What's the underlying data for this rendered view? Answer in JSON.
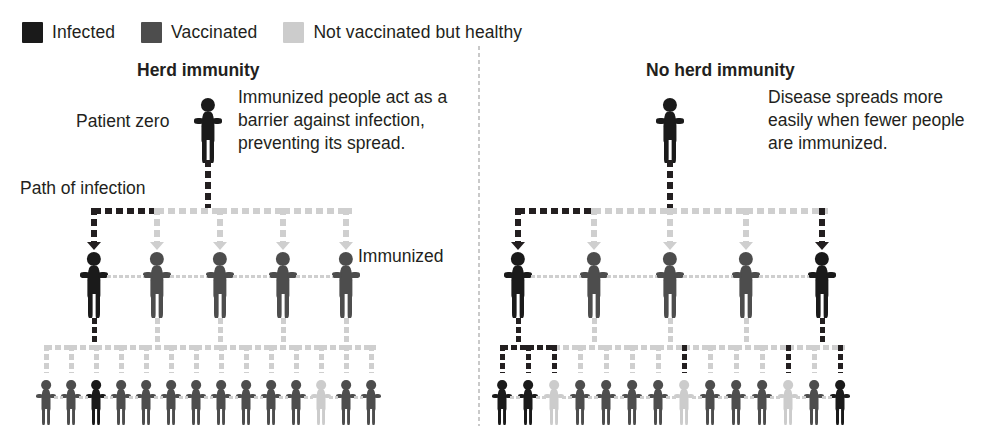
{
  "legend": {
    "items": [
      {
        "label": "Infected",
        "color": "#1a1a1a",
        "swatch_name": "legend-swatch-infected"
      },
      {
        "label": "Vaccinated",
        "color": "#4d4d4d",
        "swatch_name": "legend-swatch-vaccinated"
      },
      {
        "label": "Not vaccinated but healthy",
        "color": "#cccccc",
        "swatch_name": "legend-swatch-healthy"
      }
    ]
  },
  "colors": {
    "infected": "#1a1a1a",
    "vaccinated": "#4d4d4d",
    "healthy": "#cccccc",
    "path_infected": "#231f20",
    "path_blocked": "#cfcfcf",
    "divider": "#c9c9c9",
    "text": "#231f20"
  },
  "left_panel": {
    "title": "Herd immunity",
    "patient_zero_label": "Patient zero",
    "path_label": "Path of infection",
    "immunized_label": "Immunized",
    "callout": "Immunized people act as a barrier against infection, preventing its spread.",
    "rows": {
      "row0": [
        "infected"
      ],
      "row1": [
        "infected",
        "vaccinated",
        "vaccinated",
        "vaccinated",
        "vaccinated"
      ],
      "row2": [
        "vaccinated",
        "vaccinated",
        "infected",
        "vaccinated",
        "vaccinated",
        "vaccinated",
        "vaccinated",
        "vaccinated",
        "vaccinated",
        "vaccinated",
        "vaccinated",
        "healthy",
        "vaccinated",
        "vaccinated"
      ]
    },
    "row1_arrow_states": [
      "infected",
      "blocked",
      "blocked",
      "blocked",
      "blocked"
    ],
    "row2_arrow_states": [
      "blocked",
      "blocked",
      "blocked",
      "blocked",
      "blocked",
      "blocked",
      "blocked",
      "blocked",
      "blocked",
      "blocked",
      "blocked",
      "blocked",
      "blocked",
      "blocked"
    ]
  },
  "right_panel": {
    "title": "No herd immunity",
    "callout": "Disease spreads more easily when fewer people are immunized.",
    "rows": {
      "row0": [
        "infected"
      ],
      "row1": [
        "infected",
        "vaccinated",
        "vaccinated",
        "vaccinated",
        "infected"
      ],
      "row2": [
        "infected",
        "infected",
        "healthy",
        "vaccinated",
        "vaccinated",
        "vaccinated",
        "vaccinated",
        "healthy",
        "vaccinated",
        "vaccinated",
        "vaccinated",
        "healthy",
        "vaccinated",
        "infected"
      ]
    },
    "row1_arrow_states": [
      "infected",
      "blocked",
      "blocked",
      "blocked",
      "infected"
    ],
    "row2_arrow_states": [
      "infected",
      "infected",
      "infected",
      "blocked",
      "blocked",
      "blocked",
      "blocked",
      "infected",
      "blocked",
      "blocked",
      "blocked",
      "infected",
      "blocked",
      "infected"
    ]
  },
  "chart_data": {
    "type": "diagram",
    "panels": [
      {
        "name": "Herd immunity",
        "levels": [
          {
            "level": 0,
            "statuses": [
              "infected"
            ],
            "count": 1
          },
          {
            "level": 1,
            "statuses": [
              "infected",
              "vaccinated",
              "vaccinated",
              "vaccinated",
              "vaccinated"
            ],
            "count": 5
          },
          {
            "level": 2,
            "statuses": [
              "vaccinated",
              "vaccinated",
              "infected",
              "vaccinated",
              "vaccinated",
              "vaccinated",
              "vaccinated",
              "vaccinated",
              "vaccinated",
              "vaccinated",
              "vaccinated",
              "healthy",
              "vaccinated",
              "vaccinated"
            ],
            "count": 14
          }
        ],
        "infected_total": 3,
        "vaccinated_total": 15,
        "healthy_unvaccinated_total": 1
      },
      {
        "name": "No herd immunity",
        "levels": [
          {
            "level": 0,
            "statuses": [
              "infected"
            ],
            "count": 1
          },
          {
            "level": 1,
            "statuses": [
              "infected",
              "vaccinated",
              "vaccinated",
              "vaccinated",
              "infected"
            ],
            "count": 5
          },
          {
            "level": 2,
            "statuses": [
              "infected",
              "infected",
              "healthy",
              "vaccinated",
              "vaccinated",
              "vaccinated",
              "vaccinated",
              "healthy",
              "vaccinated",
              "vaccinated",
              "vaccinated",
              "healthy",
              "vaccinated",
              "infected"
            ],
            "count": 14
          }
        ],
        "infected_total": 6,
        "vaccinated_total": 11,
        "healthy_unvaccinated_total": 3
      }
    ],
    "legend": [
      "Infected",
      "Vaccinated",
      "Not vaccinated but healthy"
    ]
  }
}
